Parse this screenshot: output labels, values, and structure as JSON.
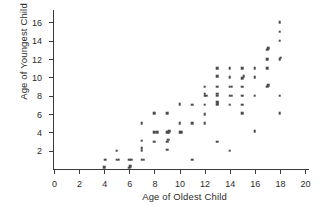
{
  "chart_data": {
    "type": "scatter",
    "title": "",
    "xlabel": "Age of Oldest Child",
    "ylabel": "Age of Youngest Child",
    "xlim": [
      0,
      20
    ],
    "ylim": [
      0,
      16.8
    ],
    "xticks": [
      0,
      2,
      4,
      6,
      8,
      10,
      12,
      14,
      16,
      18,
      20
    ],
    "yticks": [
      2,
      4,
      6,
      8,
      10,
      12,
      14,
      16
    ],
    "xtick_labels": [
      "0",
      "2",
      "4",
      "6",
      "8",
      "10",
      "12",
      "14",
      "16",
      "18",
      "20"
    ],
    "ytick_labels": [
      "2",
      "4",
      "6",
      "8",
      "10",
      "12",
      "14",
      "16"
    ],
    "grid": false,
    "legend": null,
    "marker": "square",
    "marker_color": "#4a4a4a",
    "marker_size": 2.6,
    "axis_color": "#3a3a3a",
    "background": "#ffffff",
    "points": [
      [
        4.0,
        0.2
      ],
      [
        4.1,
        1.0
      ],
      [
        5.0,
        1.0
      ],
      [
        5.15,
        1.0
      ],
      [
        5.0,
        2.0
      ],
      [
        6.0,
        0.15
      ],
      [
        6.05,
        0.3
      ],
      [
        6.0,
        1.0
      ],
      [
        6.15,
        1.0
      ],
      [
        7.0,
        1.0
      ],
      [
        7.15,
        1.0
      ],
      [
        7.0,
        2.0
      ],
      [
        7.0,
        2.3
      ],
      [
        7.0,
        3.1
      ],
      [
        7.0,
        5.0
      ],
      [
        8.0,
        3.0
      ],
      [
        8.0,
        4.0
      ],
      [
        8.2,
        4.0
      ],
      [
        8.0,
        6.1
      ],
      [
        9.0,
        2.1
      ],
      [
        9.0,
        3.0
      ],
      [
        9.1,
        3.2
      ],
      [
        9.0,
        4.0
      ],
      [
        9.15,
        4.0
      ],
      [
        9.2,
        4.15
      ],
      [
        9.0,
        6.1
      ],
      [
        10.0,
        4.0
      ],
      [
        10.15,
        4.0
      ],
      [
        10.0,
        5.0
      ],
      [
        10.0,
        7.1
      ],
      [
        11.0,
        1.0
      ],
      [
        11.0,
        5.0
      ],
      [
        11.0,
        7.0
      ],
      [
        12.0,
        5.0
      ],
      [
        12.0,
        6.0
      ],
      [
        12.0,
        7.0
      ],
      [
        12.0,
        8.0
      ],
      [
        12.15,
        8.0
      ],
      [
        12.0,
        8.2
      ],
      [
        12.0,
        9.0
      ],
      [
        13.0,
        3.0
      ],
      [
        13.0,
        7.0
      ],
      [
        13.05,
        7.15
      ],
      [
        13.0,
        7.3
      ],
      [
        13.0,
        8.0
      ],
      [
        13.0,
        8.2
      ],
      [
        13.0,
        9.0
      ],
      [
        13.0,
        10.1
      ],
      [
        13.0,
        11.0
      ],
      [
        14.0,
        2.0
      ],
      [
        14.0,
        7.0
      ],
      [
        14.0,
        8.0
      ],
      [
        14.15,
        8.0
      ],
      [
        14.0,
        9.0
      ],
      [
        14.15,
        9.0
      ],
      [
        14.0,
        10.0
      ],
      [
        14.0,
        11.0
      ],
      [
        15.0,
        6.1
      ],
      [
        15.0,
        7.0
      ],
      [
        15.0,
        8.0
      ],
      [
        15.0,
        9.0
      ],
      [
        15.0,
        9.9
      ],
      [
        15.1,
        10.1
      ],
      [
        15.0,
        11.0
      ],
      [
        16.0,
        4.1
      ],
      [
        16.0,
        8.0
      ],
      [
        16.0,
        10.0
      ],
      [
        16.0,
        11.0
      ],
      [
        17.0,
        9.0
      ],
      [
        17.05,
        9.15
      ],
      [
        17.0,
        11.0
      ],
      [
        17.0,
        12.0
      ],
      [
        17.0,
        13.0
      ],
      [
        17.05,
        13.15
      ],
      [
        18.0,
        6.1
      ],
      [
        18.0,
        8.0
      ],
      [
        18.0,
        12.0
      ],
      [
        18.05,
        12.15
      ],
      [
        18.0,
        14.0
      ],
      [
        18.0,
        15.0
      ],
      [
        18.0,
        16.0
      ]
    ]
  }
}
